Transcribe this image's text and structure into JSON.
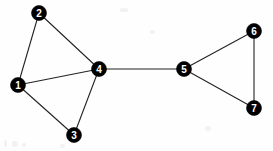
{
  "figure": {
    "width": 273,
    "height": 151,
    "background_color": "#fefefe",
    "node_fill_color": "#000000",
    "node_label_color": "#ffffff",
    "edge_color": "#232323",
    "node_radius": 7.5,
    "edge_width": 1.1
  },
  "chart_data": {
    "type": "diagram",
    "diagram_kind": "undirected-graph",
    "title": "",
    "xlabel": "",
    "ylabel": "",
    "grid": false,
    "legend": null,
    "node_count": 7,
    "edge_count": 9,
    "nodes": [
      {
        "id": "1",
        "label": "1",
        "x": 18,
        "y": 85,
        "degree": 3
      },
      {
        "id": "2",
        "label": "2",
        "x": 39,
        "y": 13,
        "degree": 2
      },
      {
        "id": "3",
        "label": "3",
        "x": 74,
        "y": 135,
        "degree": 2
      },
      {
        "id": "4",
        "label": "4",
        "x": 99,
        "y": 69,
        "degree": 4
      },
      {
        "id": "5",
        "label": "5",
        "x": 184,
        "y": 69,
        "degree": 3
      },
      {
        "id": "6",
        "label": "6",
        "x": 254,
        "y": 31,
        "degree": 2
      },
      {
        "id": "7",
        "label": "7",
        "x": 254,
        "y": 108,
        "degree": 2
      }
    ],
    "edges": [
      {
        "source": "1",
        "target": "2",
        "x1": 18,
        "y1": 85,
        "x2": 39,
        "y2": 13
      },
      {
        "source": "2",
        "target": "4",
        "x1": 39,
        "y1": 13,
        "x2": 99,
        "y2": 69
      },
      {
        "source": "1",
        "target": "4",
        "x1": 18,
        "y1": 85,
        "x2": 99,
        "y2": 69
      },
      {
        "source": "1",
        "target": "3",
        "x1": 18,
        "y1": 85,
        "x2": 74,
        "y2": 135
      },
      {
        "source": "3",
        "target": "4",
        "x1": 74,
        "y1": 135,
        "x2": 99,
        "y2": 69
      },
      {
        "source": "4",
        "target": "5",
        "x1": 99,
        "y1": 69,
        "x2": 184,
        "y2": 69
      },
      {
        "source": "5",
        "target": "6",
        "x1": 184,
        "y1": 69,
        "x2": 254,
        "y2": 31
      },
      {
        "source": "5",
        "target": "7",
        "x1": 184,
        "y1": 69,
        "x2": 254,
        "y2": 108
      },
      {
        "source": "6",
        "target": "7",
        "x1": 254,
        "y1": 31,
        "x2": 254,
        "y2": 108
      }
    ]
  }
}
